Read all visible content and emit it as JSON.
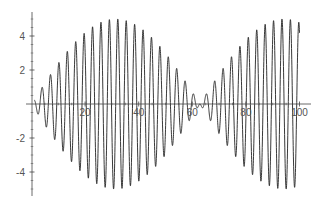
{
  "chart_data": {
    "type": "line",
    "title": "",
    "xlabel": "",
    "ylabel": "",
    "xlim": [
      0,
      100
    ],
    "ylim": [
      -5.4,
      5.4
    ],
    "grid": false,
    "legend": null,
    "x_ticks": [
      20,
      40,
      60,
      80,
      100
    ],
    "x_tick_labels": [
      "20",
      "40",
      "60",
      "80",
      "100"
    ],
    "y_ticks": [
      -4,
      -2,
      2,
      4
    ],
    "y_tick_labels": [
      "-4",
      "-2",
      "2",
      "4"
    ],
    "series": [
      {
        "name": "f(x)",
        "description": "Amplitude-modulated oscillation approx. 5 sin(x/20) sin(2x); envelope zero near x=0 and x≈63, max ≈5 near x≈31 and x≈94",
        "formula_approx": "5*sin(x/20)*sin(2*x)",
        "x_range": [
          1,
          100
        ],
        "envelope_peaks": [
          {
            "x": 31.4,
            "y": 5
          },
          {
            "x": 94.2,
            "y": 5
          }
        ],
        "envelope_zeros": [
          0,
          62.8
        ],
        "color": "#222222"
      }
    ]
  },
  "axes": {
    "color": "#444444",
    "label_color": "#555555"
  }
}
